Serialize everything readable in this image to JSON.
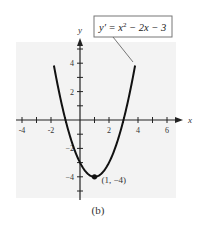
{
  "chart_data": {
    "type": "line",
    "title": "",
    "equation_label": "y' = x² − 2x − 3",
    "equation_label_parts": {
      "lhs": "y′ = x",
      "exp": "2",
      "rhs": " − 2x − 3"
    },
    "xlabel": "x",
    "ylabel": "y",
    "xlim": [
      -4.5,
      6.8
    ],
    "ylim": [
      -5.3,
      5.5
    ],
    "x_ticks": [
      -4,
      -3,
      -2,
      -1,
      1,
      2,
      3,
      4,
      5,
      6
    ],
    "x_tick_labels": [
      "-4",
      "-2",
      "2",
      "4",
      "6"
    ],
    "x_tick_label_values": [
      -4,
      -2,
      2,
      4,
      6
    ],
    "y_ticks": [
      -5,
      -4,
      -3,
      -2,
      -1,
      1,
      2,
      3,
      4,
      5
    ],
    "y_tick_labels": [
      "4",
      "2",
      "−2",
      "−4"
    ],
    "y_tick_label_values": [
      4,
      2,
      -2,
      -4
    ],
    "series": [
      {
        "name": "y' = x^2 - 2x - 3",
        "function": "x^2 - 2x - 3",
        "x": [
          -1.8,
          -1.5,
          -1,
          -0.5,
          0,
          0.5,
          1,
          1.5,
          2,
          2.5,
          3,
          3.5,
          3.8
        ],
        "values": [
          5.84,
          3.25,
          0,
          -1.75,
          -3,
          -3.75,
          -4,
          -3.75,
          -3,
          -1.75,
          0,
          2.25,
          4.84
        ]
      }
    ],
    "annotations": [
      {
        "text": "(1, −4)",
        "x": 1,
        "y": -4,
        "marker": "point"
      }
    ],
    "grid": false,
    "legend": "none",
    "caption": "(b)"
  },
  "caption": "(b)"
}
